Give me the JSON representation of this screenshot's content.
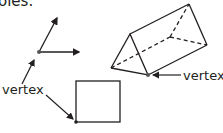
{
  "header": {
    "clipped_text": "oles."
  },
  "labels": {
    "left_vertex": "vertex",
    "right_vertex": "vertex"
  },
  "figures": [
    {
      "name": "angle",
      "description": "Two rays from a common endpoint (vertex)"
    },
    {
      "name": "triangular-prism",
      "description": "Triangular prism with dashed hidden edges"
    },
    {
      "name": "square",
      "description": "Square with vertex marked at bottom-left"
    }
  ],
  "colors": {
    "stroke": "#231f20",
    "background": "#ffffff"
  }
}
